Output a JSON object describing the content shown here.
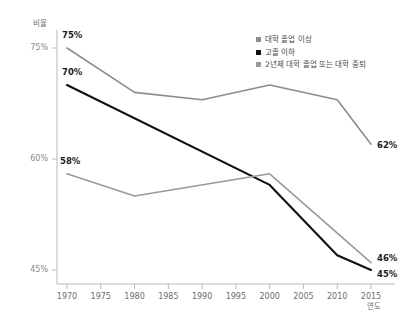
{
  "chart_data": {
    "type": "line",
    "title": "",
    "xlabel": "연도",
    "ylabel": "비율",
    "x": [
      1970,
      1975,
      1980,
      1985,
      1990,
      1995,
      2000,
      2005,
      2010,
      2015
    ],
    "xlim": [
      1968,
      2017
    ],
    "ylim": [
      43,
      77
    ],
    "xticks": [
      "1970",
      "1975",
      "1980",
      "1985",
      "1990",
      "1995",
      "2000",
      "2005",
      "2010",
      "2015"
    ],
    "yticks": [
      "75%",
      "60%",
      "45%"
    ],
    "ytick_values": [
      75,
      60,
      45
    ],
    "grid": false,
    "legend_position": "top-right",
    "series": [
      {
        "name": "대학 졸업 이상",
        "color": "#8c8c8c",
        "width": 1.6,
        "x": [
          1970,
          1980,
          1990,
          2000,
          2010,
          2015
        ],
        "values": [
          75,
          69,
          68,
          70,
          68,
          62
        ],
        "start_label": "75%",
        "end_label": "62%"
      },
      {
        "name": "고졸 이하",
        "color": "#101010",
        "width": 2.1,
        "x": [
          1970,
          2000,
          2010,
          2015
        ],
        "values": [
          70,
          56.5,
          47,
          45
        ],
        "start_label": "70%",
        "end_label": "45%"
      },
      {
        "name": "2년제 대학 졸업 또는 대학 중퇴",
        "color": "#9a9a9a",
        "width": 1.6,
        "x": [
          1970,
          1980,
          2000,
          2015
        ],
        "values": [
          58,
          55,
          58,
          46
        ],
        "start_label": "58%",
        "end_label": "46%"
      }
    ]
  },
  "axis": {
    "y_title": "비율",
    "x_title": "연도"
  },
  "legend": {
    "items": [
      {
        "label": "대학 졸업 이상",
        "color": "#8c8c8c"
      },
      {
        "label": "고졸 이하",
        "color": "#101010"
      },
      {
        "label": "2년제 대학 졸업 또는 대학 중퇴",
        "color": "#9a9a9a"
      }
    ]
  },
  "labels": {
    "start_college": "75%",
    "start_hs": "70%",
    "start_some_college": "58%",
    "end_college": "62%",
    "end_some_college": "46%",
    "end_hs": "45%"
  },
  "ticks": {
    "y": [
      "75%",
      "60%",
      "45%"
    ],
    "x": [
      "1970",
      "1975",
      "1980",
      "1985",
      "1990",
      "1995",
      "2000",
      "2005",
      "2010",
      "2015"
    ]
  }
}
